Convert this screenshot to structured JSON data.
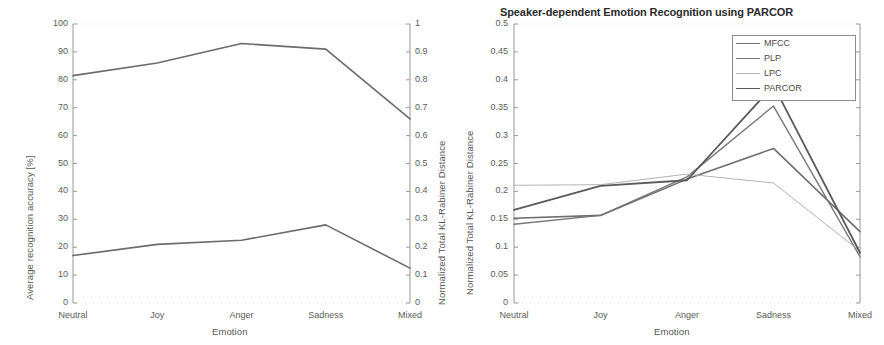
{
  "figure": {
    "width": 884,
    "height": 345,
    "background": "#ffffff"
  },
  "left_panel": {
    "xlabel": "Emotion",
    "ylabel_left": "Average recognition accuracy [%]",
    "ylabel_right": "Normalized Total KL-Rabiner Distance",
    "x_tick_labels": [
      "Neutral",
      "Joy",
      "Anger",
      "Sadness",
      "Mixed"
    ],
    "y_left_tick_labels": [
      "0",
      "10",
      "20",
      "30",
      "40",
      "50",
      "60",
      "70",
      "80",
      "90",
      "100"
    ],
    "y_right_tick_labels": [
      "0",
      "0.1",
      "0.2",
      "0.3",
      "0.4",
      "0.5",
      "0.6",
      "0.7",
      "0.8",
      "0.9",
      "1"
    ]
  },
  "right_panel": {
    "title": "Speaker-dependent Emotion Recognition using PARCOR",
    "xlabel": "Emotion",
    "ylabel": "Normalized Total KL-Rabiner Distance",
    "x_tick_labels": [
      "Neutral",
      "Joy",
      "Anger",
      "Sadness",
      "Mixed"
    ],
    "y_tick_labels": [
      "0",
      "0.05",
      "0.1",
      "0.15",
      "0.2",
      "0.25",
      "0.3",
      "0.35",
      "0.4",
      "0.45",
      "0.5"
    ],
    "legend": {
      "position": "top-right",
      "entries": [
        {
          "label": "MFCC",
          "color": "#6e6e6e",
          "width": 1.6
        },
        {
          "label": "PLP",
          "color": "#777777",
          "width": 1.4
        },
        {
          "label": "LPC",
          "color": "#b3b3b3",
          "width": 1.0
        },
        {
          "label": "PARCOR",
          "color": "#5a5a5a",
          "width": 1.8
        }
      ]
    }
  },
  "chart_data": [
    {
      "type": "line",
      "title": "",
      "xlabel": "Emotion",
      "ylabel": "Average recognition accuracy [%]",
      "ylabel_secondary": "Normalized Total KL-Rabiner Distance",
      "categories": [
        "Neutral",
        "Joy",
        "Anger",
        "Sadness",
        "Mixed"
      ],
      "ylim": [
        0,
        100
      ],
      "ylim_secondary": [
        0,
        1
      ],
      "yticks": [
        0,
        10,
        20,
        30,
        40,
        50,
        60,
        70,
        80,
        90,
        100
      ],
      "yticks_secondary": [
        0,
        0.1,
        0.2,
        0.3,
        0.4,
        0.5,
        0.6,
        0.7,
        0.8,
        0.9,
        1
      ],
      "grid": false,
      "legend": "none",
      "series": [
        {
          "name": "Average recognition accuracy [%]",
          "axis": "left",
          "color": "#6b6b6b",
          "width": 1.6,
          "values": [
            81.5,
            86.0,
            93.0,
            91.0,
            66.0
          ]
        },
        {
          "name": "Normalized Total KL-Rabiner Distance",
          "axis": "right",
          "color": "#6b6b6b",
          "width": 1.6,
          "values": [
            0.17,
            0.21,
            0.225,
            0.28,
            0.125
          ]
        }
      ]
    },
    {
      "type": "line",
      "title": "Speaker-dependent Emotion Recognition using PARCOR",
      "xlabel": "Emotion",
      "ylabel": "Normalized Total KL-Rabiner Distance",
      "categories": [
        "Neutral",
        "Joy",
        "Anger",
        "Sadness",
        "Mixed"
      ],
      "ylim": [
        0,
        0.5
      ],
      "yticks": [
        0,
        0.05,
        0.1,
        0.15,
        0.2,
        0.25,
        0.3,
        0.35,
        0.4,
        0.45,
        0.5
      ],
      "grid": false,
      "legend": "top-right",
      "series": [
        {
          "name": "MFCC",
          "color": "#6e6e6e",
          "width": 1.6,
          "values": [
            0.152,
            0.157,
            0.222,
            0.277,
            0.128
          ]
        },
        {
          "name": "PLP",
          "color": "#777777",
          "width": 1.4,
          "values": [
            0.141,
            0.157,
            0.226,
            0.353,
            0.083
          ]
        },
        {
          "name": "LPC",
          "color": "#b3b3b3",
          "width": 1.0,
          "values": [
            0.211,
            0.212,
            0.231,
            0.215,
            0.093
          ]
        },
        {
          "name": "PARCOR",
          "color": "#5a5a5a",
          "width": 1.8,
          "values": [
            0.167,
            0.21,
            0.22,
            0.39,
            0.09
          ]
        }
      ]
    }
  ]
}
